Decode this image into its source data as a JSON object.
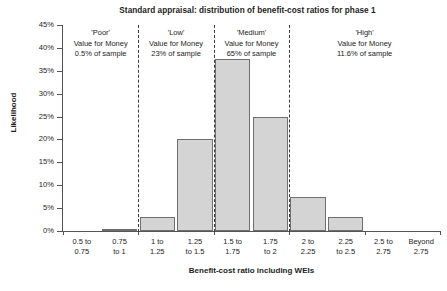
{
  "chart_data": {
    "type": "bar",
    "title": "Standard appraisal: distribution of benefit-cost ratios for phase 1",
    "xlabel": "Benefit-cost ratio including WEIs",
    "ylabel": "Likelihood",
    "ylim": [
      0,
      45
    ],
    "ytick_labels": [
      "45%",
      "40%",
      "35%",
      "30%",
      "25%",
      "20%",
      "15%",
      "10%",
      "5%",
      "0%"
    ],
    "ytick_values": [
      45,
      40,
      35,
      30,
      25,
      20,
      15,
      10,
      5,
      0
    ],
    "grid": false,
    "legend": "none",
    "categories": [
      "0.5 to 0.75",
      "0.75 to 1",
      "1 to 1.25",
      "1.25 to 1.5",
      "1.5 to 1.75",
      "1.75 to 2",
      "2 to 2.25",
      "2.25 to 2.5",
      "2.5 to 2.75",
      "Beyond 2.75"
    ],
    "category_lines": [
      [
        "0.5 to",
        "0.75"
      ],
      [
        "0.75",
        "to 1"
      ],
      [
        "1 to",
        "1.25"
      ],
      [
        "1.25",
        "to 1.5"
      ],
      [
        "1.5 to",
        "1.75"
      ],
      [
        "1.75",
        "to 2"
      ],
      [
        "2 to",
        "2.25"
      ],
      [
        "2.25",
        "to 2.5"
      ],
      [
        "2.5 to",
        "2.75"
      ],
      [
        "Beyond",
        "2.75"
      ]
    ],
    "values": [
      0,
      0.5,
      3,
      20,
      37.5,
      25,
      7.5,
      3,
      0,
      0
    ],
    "bar_color": "#d4d4d4",
    "bar_edge_color": "#6f6f6f",
    "annotations": [
      {
        "name": "poor",
        "lines": [
          "'Poor'",
          "Value for Money",
          "0.5% of sample"
        ],
        "category_span": [
          0,
          1
        ],
        "share": "0.5%"
      },
      {
        "name": "low",
        "lines": [
          "'Low'",
          "Value for Money",
          "23% of sample"
        ],
        "category_span": [
          2,
          3
        ],
        "share": "23%"
      },
      {
        "name": "medium",
        "lines": [
          "'Medium'",
          "Value for Money",
          "65% of sample"
        ],
        "category_span": [
          4,
          5
        ],
        "share": "65%"
      },
      {
        "name": "high",
        "lines": [
          "'High'",
          "Value for Money",
          "11.6% of sample"
        ],
        "category_span": [
          6,
          9
        ],
        "share": "11.6%"
      }
    ],
    "dividers_after_category": [
      1,
      3,
      5
    ]
  }
}
